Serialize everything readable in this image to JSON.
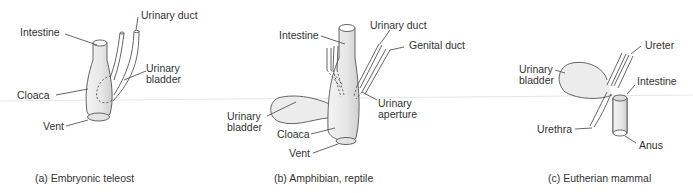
{
  "panels": [
    {
      "caption": "(a) Embryonic teleost",
      "labels": {
        "intestine": "Intestine",
        "urinary_duct": "Urinary duct",
        "urinary_bladder_1": "Urinary",
        "urinary_bladder_2": "bladder",
        "cloaca": "Cloaca",
        "vent": "Vent"
      }
    },
    {
      "caption": "(b) Amphibian, reptile",
      "labels": {
        "intestine": "Intestine",
        "urinary_duct": "Urinary duct",
        "genital_duct": "Genital duct",
        "urinary_aperture_1": "Urinary",
        "urinary_aperture_2": "aperture",
        "urinary_bladder_1": "Urinary",
        "urinary_bladder_2": "bladder",
        "cloaca": "Cloaca",
        "vent": "Vent"
      }
    },
    {
      "caption": "(c) Eutherian mammal",
      "labels": {
        "ureter": "Ureter",
        "urinary_bladder_1": "Urinary",
        "urinary_bladder_2": "bladder",
        "intestine": "Intestine",
        "urethra": "Urethra",
        "anus": "Anus"
      }
    }
  ],
  "colors": {
    "line": "#444444",
    "fill": "#e8e8e8",
    "text": "#333333"
  }
}
